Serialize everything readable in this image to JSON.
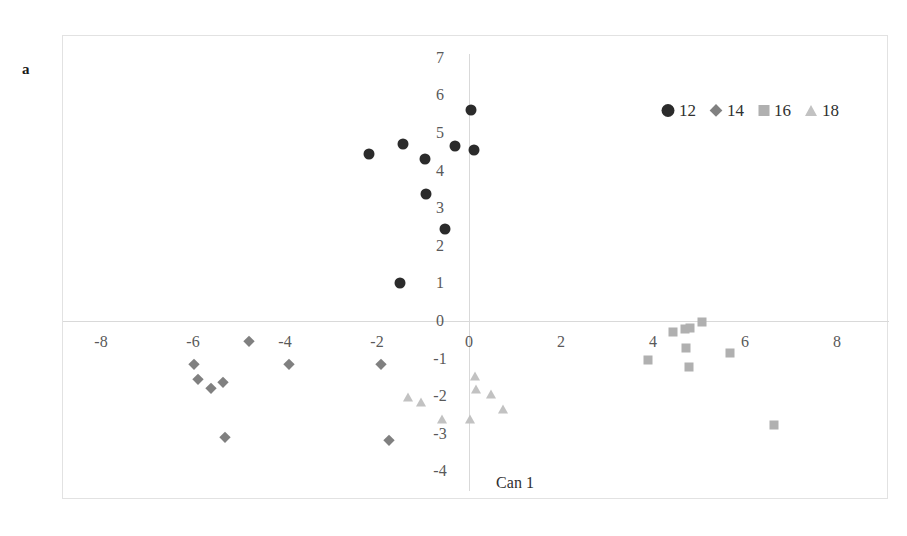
{
  "figure": {
    "panel_letter": "a",
    "background_color": "#ffffff",
    "frame_color": "#e2e2e2"
  },
  "legend": {
    "position": "top-right",
    "entries": [
      {
        "label": "12",
        "marker": "circle",
        "color": "#2b2b2b"
      },
      {
        "label": "14",
        "marker": "diamond",
        "color": "#808080"
      },
      {
        "label": "16",
        "marker": "square",
        "color": "#b0b0b0"
      },
      {
        "label": "18",
        "marker": "triangle",
        "color": "#c2c2c2"
      }
    ]
  },
  "chart_data": {
    "type": "scatter",
    "title": "",
    "xlabel": "Can 1",
    "ylabel": "Can 2",
    "xlim": [
      -9,
      9
    ],
    "ylim": [
      -4.7,
      7.4
    ],
    "xticks": [
      -8,
      -6,
      -4,
      -2,
      0,
      2,
      4,
      6,
      8
    ],
    "xtick_labels": [
      "-8",
      "-6",
      "-4",
      "-2",
      "0",
      "2",
      "4",
      "6",
      "8"
    ],
    "yticks": [
      -4,
      -3,
      -2,
      -1,
      0,
      1,
      2,
      3,
      4,
      5,
      6,
      7
    ],
    "ytick_labels": [
      "-4",
      "-3",
      "-2",
      "-1",
      "0",
      "1",
      "2",
      "3",
      "4",
      "5",
      "6",
      "7"
    ],
    "grid": false,
    "axis_lines": [
      "x-zero",
      "y-zero"
    ],
    "series": [
      {
        "name": "12",
        "marker": "circle",
        "color": "#2b2b2b",
        "size": 11,
        "points": [
          [
            -2.17,
            4.44
          ],
          [
            -1.43,
            4.71
          ],
          [
            -0.96,
            4.31
          ],
          [
            0.04,
            5.61
          ],
          [
            -0.3,
            4.65
          ],
          [
            0.11,
            4.55
          ],
          [
            -0.93,
            3.38
          ],
          [
            -0.52,
            2.45
          ],
          [
            -1.5,
            1.01
          ]
        ]
      },
      {
        "name": "14",
        "marker": "diamond",
        "color": "#808080",
        "size": 10,
        "points": [
          [
            -5.98,
            -1.14
          ],
          [
            -5.89,
            -1.54
          ],
          [
            -5.61,
            -1.78
          ],
          [
            -5.35,
            -1.62
          ],
          [
            -4.78,
            -0.53
          ],
          [
            -3.91,
            -1.14
          ],
          [
            -1.91,
            -1.14
          ],
          [
            -5.3,
            -3.09
          ],
          [
            -1.74,
            -3.16
          ]
        ]
      },
      {
        "name": "16",
        "marker": "square",
        "color": "#b0b0b0",
        "size": 9,
        "points": [
          [
            3.89,
            -1.04
          ],
          [
            4.43,
            -0.29
          ],
          [
            4.7,
            -0.21
          ],
          [
            4.8,
            -0.19
          ],
          [
            5.07,
            -0.03
          ],
          [
            4.72,
            -0.72
          ],
          [
            4.78,
            -1.22
          ],
          [
            5.67,
            -0.85
          ],
          [
            6.63,
            -2.77
          ]
        ]
      },
      {
        "name": "18",
        "marker": "triangle",
        "color": "#c2c2c2",
        "size": 10,
        "points": [
          [
            -1.33,
            -2.02
          ],
          [
            -1.04,
            -2.15
          ],
          [
            0.13,
            -1.46
          ],
          [
            0.15,
            -1.81
          ],
          [
            0.48,
            -1.94
          ],
          [
            0.74,
            -2.34
          ],
          [
            -0.59,
            -2.61
          ],
          [
            0.02,
            -2.61
          ]
        ]
      }
    ]
  }
}
